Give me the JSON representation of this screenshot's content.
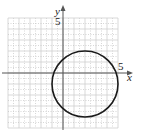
{
  "chart_data": {
    "type": "line",
    "title": "",
    "xlabel": "x",
    "ylabel": "y",
    "xlim": [
      -5,
      5
    ],
    "ylim": [
      -5,
      5
    ],
    "grid": true,
    "x_tick_labels": [
      {
        "value": 5,
        "label": "5"
      }
    ],
    "y_tick_labels": [
      {
        "value": 5,
        "label": "5"
      }
    ],
    "series": [
      {
        "name": "circle",
        "shape": "circle",
        "center": [
          2,
          -1
        ],
        "radius": 3,
        "equation": "(x-2)^2 + (y+1)^2 = 9"
      }
    ]
  },
  "labels": {
    "x_axis": "x",
    "y_axis": "y",
    "x_tick_5": "5",
    "y_tick_5": "5"
  },
  "colors": {
    "axis": "#555555",
    "grid_major": "#cfcfcf",
    "grid_minor": "#bdbdbd",
    "curve": "#1a1a1a"
  }
}
